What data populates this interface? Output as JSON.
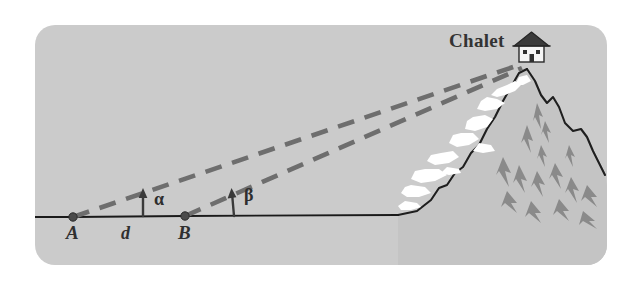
{
  "figure": {
    "title_label": "Chalet",
    "point_a_label": "A",
    "point_b_label": "B",
    "distance_label": "d",
    "angle_alpha_label": "α",
    "angle_beta_label": "β",
    "house_icon_name": "chalet-house-icon",
    "mountain_icon_name": "mountain-peak-icon"
  },
  "colors": {
    "panel_background": "#cbcbcb",
    "page_background": "#ffffff",
    "line_of_sight": "#6e6e6e",
    "ground_line": "#1a1a1a",
    "text": "#2b2b2b",
    "snow": "#ffffff",
    "rock_shade": "#8c8c8c",
    "house_roof": "#3a3a3a",
    "house_wall": "#f2f2f2"
  },
  "geometry": {
    "panel": {
      "x": 35,
      "y": 25,
      "width": 572,
      "height": 240,
      "corner_radius": 20
    },
    "point_a": {
      "x": 38,
      "y": 192
    },
    "point_b": {
      "x": 150,
      "y": 191
    },
    "chalet_peak": {
      "x": 487,
      "y": 37
    },
    "ground_flat_end": {
      "x": 363,
      "y": 190
    },
    "alpha_arrow_x": 108,
    "beta_arrow_x": 199
  }
}
